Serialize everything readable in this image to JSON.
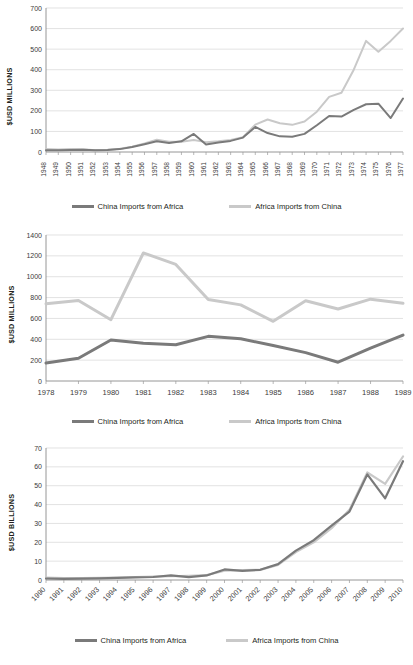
{
  "legend": {
    "series_dark": "China Imports from Africa",
    "series_light": "Africa Imports from China",
    "color_dark": "#7a7a7a",
    "color_light": "#c9c9c9"
  },
  "axis_labels": {
    "millions": "$USD MILLIONS",
    "billions": "$USD BILLIONS"
  },
  "chart_data": [
    {
      "type": "line",
      "title": "",
      "xlabel": "",
      "ylabel": "$USD MILLIONS",
      "ylim": [
        0,
        700
      ],
      "yticks": [
        0,
        100,
        200,
        300,
        400,
        500,
        600,
        700
      ],
      "grid": true,
      "legend_position": "bottom",
      "categories": [
        "1948",
        "1949",
        "1950",
        "1951",
        "1952",
        "1953",
        "1954",
        "1955",
        "1956",
        "1957",
        "1958",
        "1959",
        "1960",
        "1961",
        "1962",
        "1963",
        "1964",
        "1965",
        "1966",
        "1967",
        "1968",
        "1969",
        "1970",
        "1971",
        "1972",
        "1973",
        "1974",
        "1975",
        "1976",
        "1977"
      ],
      "series": [
        {
          "name": "China Imports from Africa",
          "color": "#7a7a7a",
          "values": [
            8,
            9,
            10,
            11,
            8,
            10,
            14,
            24,
            38,
            52,
            44,
            52,
            88,
            36,
            46,
            54,
            70,
            122,
            92,
            76,
            74,
            88,
            130,
            175,
            172,
            205,
            232,
            235,
            165,
            260
          ]
        },
        {
          "name": "Africa Imports from China",
          "color": "#c9c9c9",
          "values": [
            14,
            12,
            14,
            13,
            9,
            11,
            16,
            26,
            42,
            60,
            50,
            50,
            58,
            48,
            52,
            58,
            72,
            133,
            158,
            140,
            132,
            148,
            196,
            268,
            288,
            400,
            540,
            487,
            540,
            600
          ]
        }
      ]
    },
    {
      "type": "line",
      "title": "",
      "xlabel": "",
      "ylabel": "$USD MILLIONS",
      "ylim": [
        0,
        1400
      ],
      "yticks": [
        0,
        200,
        400,
        600,
        800,
        1000,
        1200,
        1400
      ],
      "grid": true,
      "legend_position": "bottom",
      "categories": [
        "1978",
        "1979",
        "1980",
        "1981",
        "1982",
        "1983",
        "1984",
        "1985",
        "1986",
        "1987",
        "1988",
        "1989"
      ],
      "series": [
        {
          "name": "China Imports from Africa",
          "color": "#7a7a7a",
          "values": [
            172,
            218,
            393,
            363,
            348,
            428,
            405,
            340,
            272,
            180,
            315,
            440
          ]
        },
        {
          "name": "Africa Imports from China",
          "color": "#c9c9c9",
          "values": [
            740,
            772,
            588,
            1228,
            1118,
            782,
            730,
            572,
            770,
            690,
            785,
            745
          ]
        }
      ]
    },
    {
      "type": "line",
      "title": "",
      "xlabel": "",
      "ylabel": "$USD BILLIONS",
      "ylim": [
        0,
        70
      ],
      "yticks": [
        0,
        10,
        20,
        30,
        40,
        50,
        60,
        70
      ],
      "grid": true,
      "legend_position": "bottom",
      "categories": [
        "1990",
        "1991",
        "1992",
        "1993",
        "1994",
        "1995",
        "1996",
        "1997",
        "1998",
        "1999",
        "2000",
        "2001",
        "2002",
        "2003",
        "2004",
        "2005",
        "2006",
        "2007",
        "2008",
        "2009",
        "2010"
      ],
      "series": [
        {
          "name": "China Imports from Africa",
          "color": "#7a7a7a",
          "values": [
            0.8,
            0.6,
            0.7,
            0.9,
            1.1,
            1.4,
            1.6,
            2.4,
            1.5,
            2.4,
            5.6,
            4.8,
            5.4,
            8.4,
            15.6,
            21.1,
            28.8,
            36.3,
            56.0,
            43.3,
            63.0
          ]
        },
        {
          "name": "Africa Imports from China",
          "color": "#c9c9c9",
          "values": [
            1.3,
            1.0,
            1.0,
            1.2,
            1.3,
            1.6,
            1.8,
            2.0,
            2.2,
            2.6,
            5.0,
            5.2,
            5.4,
            8.0,
            14.8,
            20.0,
            27.5,
            37.2,
            57.0,
            51.0,
            65.5
          ]
        }
      ]
    }
  ]
}
